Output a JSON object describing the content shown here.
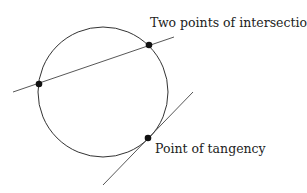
{
  "labels": {
    "intersection": "Two points of intersection",
    "tangency": "Point of tangency"
  },
  "colors": {
    "stroke": "#333333",
    "point": "#111111",
    "text": "#222222"
  }
}
